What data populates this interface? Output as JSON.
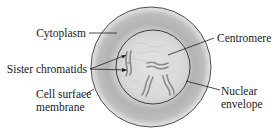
{
  "figure": {
    "type": "cell-diagram"
  },
  "labels": {
    "cytoplasm": "Cytoplasm",
    "sister_chromatids": "Sister chromatids",
    "cell_surface_membrane_line1": "Cell surface",
    "cell_surface_membrane_line2": "membrane",
    "centromere": "Centromere",
    "nuclear_envelope_line1": "Nuclear",
    "nuclear_envelope_line2": "envelope"
  },
  "colors": {
    "outline": "#3a3a3a",
    "cytoplasm_dark": "#a9a9a9",
    "cytoplasm_light": "#e4e4e4",
    "nucleus": "#dcdcdc",
    "chromatid": "#8a8a8a",
    "leader_line": "#222222",
    "text": "#1a1a1a"
  }
}
